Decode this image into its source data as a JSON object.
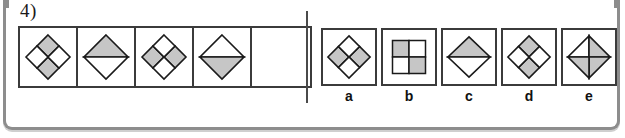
{
  "question": {
    "number_label": "4)",
    "type": "figure-series-pattern-completion"
  },
  "colors": {
    "shade_fill": "#c6c6c6",
    "shape_stroke": "#1a1a1a",
    "cell_border": "#3b3b3b",
    "frame_border": "#8d8d8d",
    "background": "#ffffff",
    "divider": "#4a4a4a"
  },
  "sequence": {
    "cell_count": 5,
    "cells": [
      {
        "index": 1,
        "name": "sequence-cell-1",
        "shape": "diamond-quadrants",
        "description": "Diamond divided into four quadrants; top and bottom quadrants shaded.",
        "shaded": [
          "top",
          "bottom"
        ]
      },
      {
        "index": 2,
        "name": "sequence-cell-2",
        "shape": "diamond-halves-horizontal",
        "description": "Diamond split by a horizontal line; upper half shaded.",
        "shaded": [
          "top"
        ]
      },
      {
        "index": 3,
        "name": "sequence-cell-3",
        "shape": "diamond-quadrants",
        "description": "Diamond divided into four quadrants; left and right quadrants shaded.",
        "shaded": [
          "left",
          "right"
        ]
      },
      {
        "index": 4,
        "name": "sequence-cell-4",
        "shape": "diamond-halves-horizontal",
        "description": "Diamond split by a horizontal line; lower half shaded.",
        "shaded": [
          "bottom"
        ]
      },
      {
        "index": 5,
        "name": "sequence-cell-blank",
        "shape": "empty",
        "description": "Empty cell - the missing figure to be selected.",
        "shaded": []
      }
    ]
  },
  "options": [
    {
      "label": "a",
      "shape": "diamond-quadrants",
      "description": "Diamond divided into four quadrants; left and right quadrants shaded.",
      "shaded": [
        "left",
        "right"
      ]
    },
    {
      "label": "b",
      "shape": "square-quadrants",
      "description": "Upright square divided into four quadrants; top-left and bottom-right shaded.",
      "shaded": [
        "top-left",
        "bottom-right"
      ]
    },
    {
      "label": "c",
      "shape": "diamond-halves-horizontal",
      "description": "Diamond split by a horizontal line; upper half shaded.",
      "shaded": [
        "top"
      ]
    },
    {
      "label": "d",
      "shape": "diamond-quadrants",
      "description": "Diamond divided into four quadrants; top and bottom quadrants shaded.",
      "shaded": [
        "top",
        "bottom"
      ]
    },
    {
      "label": "e",
      "shape": "diamond-cross-triangles",
      "description": "Diamond split by vertical and horizontal lines into four triangles; right and bottom triangles shaded.",
      "shaded": [
        "right",
        "bottom"
      ]
    }
  ]
}
